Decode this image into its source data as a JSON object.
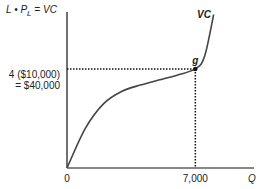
{
  "chart_data": {
    "type": "line",
    "title": "",
    "ylabel": "L • P_L = VC",
    "ylabel_parts": {
      "main": "L • P",
      "sub": "L",
      "rest": " = VC"
    },
    "xlabel": "Q",
    "series": [
      {
        "name": "VC",
        "shape": "cubic (concave then convex)",
        "points_x": [
          0,
          1000,
          2000,
          3000,
          4000,
          5000,
          6000,
          7000,
          7500,
          8000
        ],
        "points_y": [
          0,
          16000,
          26000,
          31000,
          33500,
          35500,
          37500,
          40000,
          45000,
          62000
        ]
      }
    ],
    "highlight_point": {
      "label": "g",
      "x": 7000,
      "y": 40000
    },
    "y_annotation": [
      "4 ($10,000)",
      "= $40,000"
    ],
    "x_ticks": [
      "0",
      "7,000"
    ],
    "xlim": [
      0,
      10200
    ],
    "ylim": [
      0,
      63000
    ],
    "curve_label": "VC",
    "grid": false,
    "legend": "none"
  }
}
